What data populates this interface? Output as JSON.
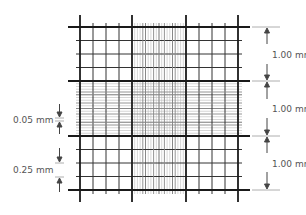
{
  "labels": {
    "right_top": "1.00 mm",
    "right_middle": "1.00 mm",
    "right_bottom": "1.00 mm",
    "left_fine": "0.05 mm",
    "left_medium": "0.25 mm"
  },
  "grid": {
    "x_start": 80,
    "x_end": 238,
    "y_start": 27,
    "y_end": 190,
    "large_square_count": 3,
    "medium_subdivisions_per_large": 4,
    "fine_subdivisions_in_center": 20,
    "colors": {
      "thick": "#1a1a1a",
      "medium": "#333333",
      "fine": "#888888",
      "dim": "#bbbbbb"
    }
  }
}
